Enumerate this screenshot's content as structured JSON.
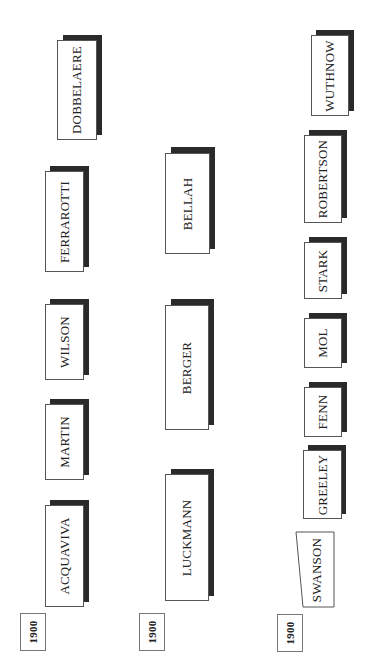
{
  "diagram": {
    "type": "timeline-columns",
    "orientation": "rotated-90",
    "columns": [
      {
        "year": "1900",
        "names": [
          "DOBBELAERE",
          "FERRAROTTI",
          "WILSON",
          "MARTIN",
          "ACQUAVIVA"
        ]
      },
      {
        "year": "1900",
        "names": [
          "BELLAH",
          "BERGER",
          "LUCKMANN"
        ]
      },
      {
        "year": "1900",
        "names": [
          "WUTHNOW",
          "ROBERTSON",
          "STARK",
          "MOL",
          "FENN",
          "GREELEY",
          "SWANSON"
        ]
      }
    ]
  },
  "col1": {
    "year": "1900",
    "n0": "DOBBELAERE",
    "n1": "FERRAROTTI",
    "n2": "WILSON",
    "n3": "MARTIN",
    "n4": "ACQUAVIVA"
  },
  "col2": {
    "year": "1900",
    "n0": "BELLAH",
    "n1": "BERGER",
    "n2": "LUCKMANN"
  },
  "col3": {
    "year": "1900",
    "n0": "WUTHNOW",
    "n1": "ROBERTSON",
    "n2": "STARK",
    "n3": "MOL",
    "n4": "FENN",
    "n5": "GREELEY",
    "n6": "SWANSON"
  },
  "colors": {
    "shadow": "#2a2a2a",
    "border": "#555555",
    "background": "#ffffff"
  }
}
